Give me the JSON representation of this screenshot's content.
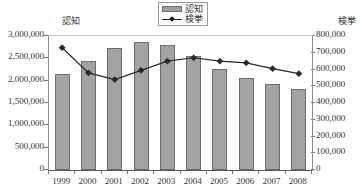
{
  "legend": {
    "items": [
      {
        "label": "認知",
        "type": "bar-swatch",
        "color": "#a3a3a3"
      },
      {
        "label": "検挙",
        "type": "line-swatch",
        "color": "#2a2a2a"
      }
    ]
  },
  "axes": {
    "left_title": "認知",
    "right_title": "検挙",
    "left_ticks": [
      "0",
      "500,000",
      "1,000,000",
      "1,500,000",
      "2,000,000",
      "2,500,000",
      "3,000,000"
    ],
    "right_ticks": [
      "0",
      "100,000",
      "200,000",
      "300,000",
      "400,000",
      "500,000",
      "600,000",
      "700,000",
      "800,000"
    ]
  },
  "chart_data": {
    "type": "bar",
    "title": "",
    "xlabel": "",
    "ylabel": "認知",
    "y2label": "検挙",
    "categories": [
      "1999",
      "2000",
      "2001",
      "2002",
      "2003",
      "2004",
      "2005",
      "2006",
      "2007",
      "2008"
    ],
    "ylim": [
      0,
      3000000
    ],
    "y2lim": [
      0,
      800000
    ],
    "ytick_step": 500000,
    "y2tick_step": 100000,
    "grid": false,
    "legend_position": "top-center",
    "series": [
      {
        "name": "認知",
        "type": "bar",
        "axis": "left",
        "color": "#a3a3a3",
        "values": [
          2160000,
          2450000,
          2740000,
          2860000,
          2790000,
          2560000,
          2270000,
          2050000,
          1930000,
          1810000
        ]
      },
      {
        "name": "検挙",
        "type": "line",
        "axis": "right",
        "color": "#2a2a2a",
        "marker": "diamond",
        "values": [
          730000,
          580000,
          540000,
          595000,
          650000,
          670000,
          650000,
          640000,
          605000,
          575000
        ]
      }
    ]
  }
}
